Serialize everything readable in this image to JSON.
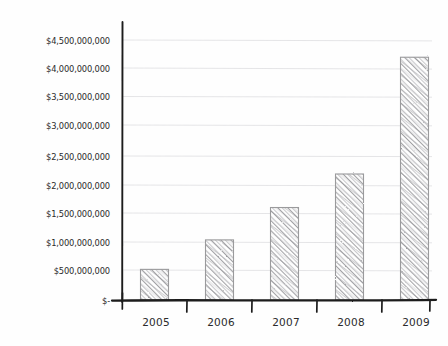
{
  "chart_data": {
    "type": "bar",
    "title": "",
    "subtitle": "",
    "xlabel": "",
    "ylabel": "",
    "categories": [
      "2005",
      "2006",
      "2007",
      "2008",
      "2009"
    ],
    "values": [
      530000000,
      1040000000,
      1600000000,
      2180000000,
      4200000000
    ],
    "series": [
      {
        "name": "",
        "values": [
          530000000,
          1040000000,
          1600000000,
          2180000000,
          4200000000
        ]
      }
    ],
    "ylim": [
      0,
      4750000000
    ],
    "ytick_values": [
      0,
      500000000,
      1000000000,
      1500000000,
      2000000000,
      2500000000,
      3000000000,
      3500000000,
      4000000000,
      4500000000
    ],
    "ytick_labels": [
      "$-",
      "$500,000,000",
      "$1,000,000,000",
      "$1,500,000,000",
      "$2,000,000,000",
      "$2,500,000,000",
      "$3,000,000,000",
      "$3,500,000,000",
      "$4,000,000,000",
      "$4,500,000,000"
    ],
    "grid": true,
    "legend": false,
    "legend_position": "none",
    "style": "hand-drawn-sketch",
    "colors": {
      "axis": "#1d1d1d",
      "gridline": "#e2e2e4",
      "bar_fill": "#9d9da0",
      "bar_outline": "#9a9a9c",
      "text": "#2b2b2b",
      "background": "#fefefe"
    }
  }
}
